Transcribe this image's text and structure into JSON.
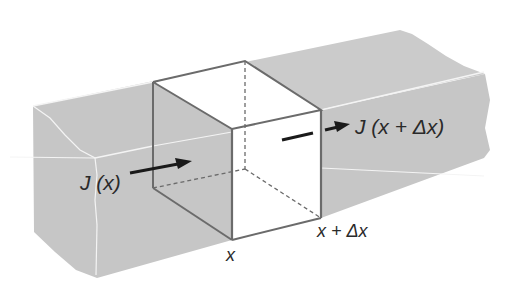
{
  "figure": {
    "colors": {
      "background": "#ffffff",
      "slab": "#c8c8c8",
      "slab_highlight": "#f2f2f2",
      "cube_face": "#ffffff",
      "cube_edge": "#6b6b6b",
      "arrow": "#1a1a1a",
      "text": "#2a2a2a"
    },
    "labels": {
      "flux_in": "J (x)",
      "flux_out": "J (x + Δx)",
      "position_left": "x",
      "position_right": "x + Δx"
    }
  }
}
